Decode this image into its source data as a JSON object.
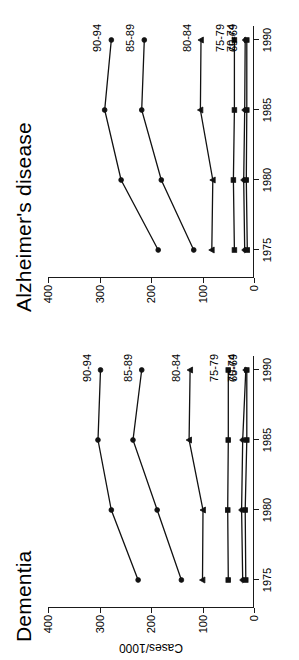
{
  "figure": {
    "orientation": "rotated-90-ccw",
    "y_axis_title": "Cases/1000",
    "y_ticks": [
      0,
      100,
      200,
      300,
      400
    ],
    "x_ticks": [
      1975,
      1980,
      1985,
      1990
    ],
    "x_tick_labels": [
      "1975",
      "1980",
      "1985",
      "1990"
    ],
    "y_tick_labels": [
      "0",
      "100",
      "200",
      "300",
      "400"
    ]
  },
  "chart_data": [
    {
      "type": "line",
      "title": "Dementia",
      "xlabel": "",
      "ylabel": "Cases/1000",
      "x": [
        1975,
        1980,
        1985,
        1990
      ],
      "xlim": [
        1973,
        1991
      ],
      "ylim": [
        0,
        400
      ],
      "grid": false,
      "legend": "inline-right-labels",
      "series": [
        {
          "name": "90-94",
          "label": "90-94",
          "marker": "circle",
          "values": [
            225,
            277,
            303,
            298
          ]
        },
        {
          "name": "85-89",
          "label": "85-89",
          "marker": "circle",
          "values": [
            141,
            188,
            235,
            218
          ]
        },
        {
          "name": "80-84",
          "label": "80-84",
          "marker": "triangle",
          "values": [
            100,
            99,
            126,
            124
          ]
        },
        {
          "name": "75-79",
          "label": "75-79",
          "marker": "square",
          "values": [
            50,
            51,
            50,
            50
          ]
        },
        {
          "name": "70-74",
          "label": "70-74",
          "marker": "diamond",
          "values": [
            22,
            24,
            22,
            16
          ]
        },
        {
          "name": "65-69",
          "label": "65-69",
          "marker": "square",
          "values": [
            16,
            17,
            14,
            14
          ]
        }
      ]
    },
    {
      "type": "line",
      "title": "Alzheimer's disease",
      "xlabel": "",
      "ylabel": "Cases/1000",
      "x": [
        1975,
        1980,
        1985,
        1990
      ],
      "xlim": [
        1973,
        1991
      ],
      "ylim": [
        0,
        400
      ],
      "grid": false,
      "legend": "inline-right-labels",
      "series": [
        {
          "name": "90-94",
          "label": "90-94",
          "marker": "circle",
          "values": [
            186,
            258,
            290,
            277
          ]
        },
        {
          "name": "85-89",
          "label": "85-89",
          "marker": "circle",
          "values": [
            117,
            180,
            218,
            213
          ]
        },
        {
          "name": "80-84",
          "label": "80-84",
          "marker": "triangle",
          "values": [
            82,
            80,
            104,
            103
          ]
        },
        {
          "name": "75-79",
          "label": "75-79",
          "marker": "square",
          "values": [
            38,
            40,
            38,
            38
          ]
        },
        {
          "name": "70-74",
          "label": "70-74",
          "marker": "diamond",
          "values": [
            18,
            20,
            18,
            17
          ]
        },
        {
          "name": "65-69",
          "label": "65-69",
          "marker": "square",
          "values": [
            13,
            15,
            14,
            14
          ]
        }
      ]
    }
  ]
}
